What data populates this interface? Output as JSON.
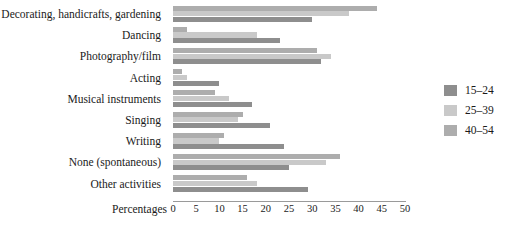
{
  "chart_data": {
    "type": "bar",
    "orientation": "horizontal",
    "title": "",
    "xlabel": "Percentages",
    "ylabel": "",
    "xlim": [
      0,
      50
    ],
    "xticks": [
      0,
      5,
      10,
      15,
      20,
      25,
      30,
      35,
      40,
      45,
      50
    ],
    "grid": false,
    "legend_position": "right",
    "categories": [
      "Decorating, handicrafts, gardening",
      "Dancing",
      "Photography/film",
      "Acting",
      "Musical instruments",
      "Singing",
      "Writing",
      "None (spontaneous)",
      "Other activities"
    ],
    "series": [
      {
        "name": "40–54",
        "color": "#adadad",
        "values": [
          44,
          3,
          31,
          2,
          9,
          15,
          11,
          36,
          16
        ]
      },
      {
        "name": "25–39",
        "color": "#c9c9c9",
        "values": [
          38,
          18,
          34,
          3,
          12,
          14,
          10,
          33,
          18
        ]
      },
      {
        "name": "15–24",
        "color": "#8e8e8e",
        "values": [
          30,
          23,
          32,
          10,
          17,
          21,
          24,
          25,
          29
        ]
      }
    ]
  },
  "legend": {
    "items": [
      {
        "label": "15–24",
        "color": "#8e8e8e",
        "icon": "legend-swatch-icon"
      },
      {
        "label": "25–39",
        "color": "#c9c9c9",
        "icon": "legend-swatch-icon"
      },
      {
        "label": "40–54",
        "color": "#adadad",
        "icon": "legend-swatch-icon"
      }
    ]
  },
  "axis": {
    "title": "Percentages"
  }
}
